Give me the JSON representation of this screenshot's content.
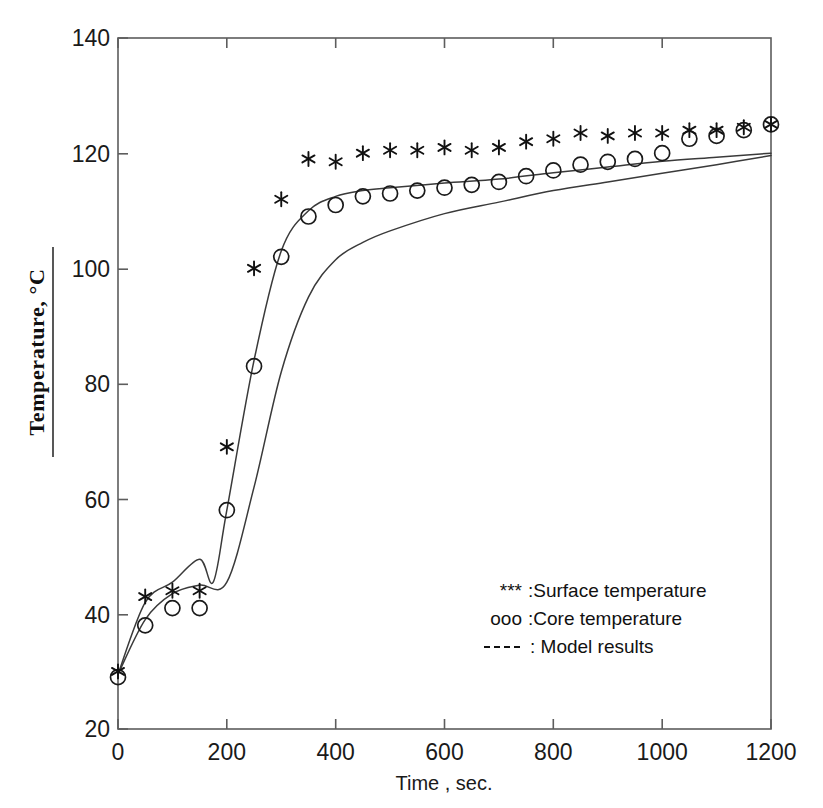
{
  "figure": {
    "background_color": "#ffffff",
    "ink_color": "#1a1a1a",
    "ylabel": "Temperature, °C",
    "xlabel": "Time , sec."
  },
  "legend": {
    "position": "inside-lower-right",
    "entries": [
      {
        "symbol": "***",
        "label": ":Surface temperature",
        "marker": "star"
      },
      {
        "symbol": "ooo",
        "label": ":Core temperature",
        "marker": "circle"
      },
      {
        "symbol": "----",
        "label": ": Model results",
        "marker": "dashed-line"
      }
    ]
  },
  "axes": {
    "x_ticks": [
      "0",
      "200",
      "400",
      "600",
      "800",
      "1000",
      "1200"
    ],
    "y_ticks": [
      "20",
      "40",
      "60",
      "80",
      "100",
      "120",
      "140"
    ]
  },
  "chart_data": {
    "type": "scatter",
    "title": "",
    "xlabel": "Time , sec.",
    "ylabel": "Temperature, °C",
    "xlim": [
      0,
      1200
    ],
    "ylim": [
      20,
      140
    ],
    "xticks": [
      0,
      200,
      400,
      600,
      800,
      1000,
      1200
    ],
    "yticks": [
      20,
      40,
      60,
      80,
      100,
      120,
      140
    ],
    "grid": false,
    "legend_position": "inside lower right",
    "series": [
      {
        "name": "Surface temperature",
        "marker": "star",
        "style": "markers",
        "x": [
          0,
          50,
          100,
          150,
          200,
          250,
          300,
          350,
          400,
          450,
          500,
          550,
          600,
          650,
          700,
          750,
          800,
          850,
          900,
          950,
          1000,
          1050,
          1100,
          1150,
          1200
        ],
        "y": [
          30,
          43,
          44,
          44,
          69,
          100,
          112,
          119,
          118.5,
          120,
          120.5,
          120.5,
          121,
          120.5,
          121,
          122,
          122.5,
          123.5,
          123,
          123.5,
          123.5,
          124,
          124,
          124.5,
          125
        ]
      },
      {
        "name": "Core temperature",
        "marker": "circle",
        "style": "markers",
        "x": [
          0,
          50,
          100,
          150,
          200,
          250,
          300,
          350,
          400,
          450,
          500,
          550,
          600,
          650,
          700,
          750,
          800,
          850,
          900,
          950,
          1000,
          1050,
          1100,
          1150,
          1200
        ],
        "y": [
          29,
          38,
          41,
          41,
          58,
          83,
          102,
          109,
          111,
          112.5,
          113,
          113.5,
          114,
          114.5,
          115,
          116,
          117,
          118,
          118.5,
          119,
          120,
          122.5,
          123,
          124,
          125
        ]
      },
      {
        "name": "Model results (surface / core-fitting curve)",
        "marker": "none",
        "style": "line",
        "x": [
          0,
          50,
          100,
          150,
          175,
          200,
          250,
          300,
          350,
          400,
          450,
          500,
          600,
          700,
          800,
          900,
          1000,
          1100,
          1200
        ],
        "y": [
          29.5,
          42,
          45.5,
          49.5,
          45.5,
          58,
          84,
          103,
          110,
          112.5,
          113.5,
          114,
          114.8,
          115.5,
          116.6,
          117.6,
          118.6,
          119.3,
          120
        ]
      },
      {
        "name": "Model results (lower / internal curve)",
        "marker": "none",
        "style": "line",
        "x": [
          0,
          50,
          100,
          150,
          200,
          250,
          300,
          350,
          400,
          450,
          500,
          600,
          700,
          800,
          900,
          1000,
          1100,
          1200
        ],
        "y": [
          29.5,
          39,
          43.5,
          45,
          45.5,
          62,
          82,
          95,
          101.5,
          104.5,
          106.5,
          109.5,
          111.5,
          113.5,
          115,
          116.5,
          118,
          119.6
        ]
      }
    ]
  }
}
